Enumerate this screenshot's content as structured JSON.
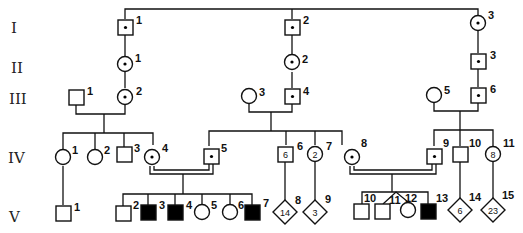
{
  "generations": [
    "I",
    "II",
    "III",
    "IV",
    "V"
  ],
  "colors": {
    "line": "#111111",
    "affected": "#000000",
    "unaffected": "#ffffff"
  },
  "legend_semantics": {
    "filled": "affected",
    "dot": "carrier",
    "double_line": "consanguineous mating",
    "diamond_number": "multiple individuals of unspecified sex"
  },
  "individuals": {
    "I-1": {
      "label": "1",
      "sex": "male",
      "status": "carrier"
    },
    "I-2": {
      "label": "2",
      "sex": "male",
      "status": "carrier"
    },
    "I-3": {
      "label": "3",
      "sex": "female",
      "status": "carrier"
    },
    "II-1": {
      "label": "1",
      "sex": "female",
      "status": "carrier"
    },
    "II-2": {
      "label": "2",
      "sex": "female",
      "status": "carrier"
    },
    "II-3": {
      "label": "3",
      "sex": "male",
      "status": "carrier"
    },
    "III-1": {
      "label": "1",
      "sex": "male",
      "status": "unaffected"
    },
    "III-2": {
      "label": "2",
      "sex": "female",
      "status": "carrier"
    },
    "III-3": {
      "label": "3",
      "sex": "female",
      "status": "unaffected"
    },
    "III-4": {
      "label": "4",
      "sex": "male",
      "status": "carrier"
    },
    "III-5": {
      "label": "5",
      "sex": "female",
      "status": "unaffected"
    },
    "III-6": {
      "label": "6",
      "sex": "male",
      "status": "carrier"
    },
    "IV-1": {
      "label": "1",
      "sex": "female",
      "status": "unaffected"
    },
    "IV-2": {
      "label": "2",
      "sex": "female",
      "status": "unaffected"
    },
    "IV-3": {
      "label": "3",
      "sex": "male",
      "status": "unaffected"
    },
    "IV-4": {
      "label": "4",
      "sex": "female",
      "status": "carrier"
    },
    "IV-5": {
      "label": "5",
      "sex": "male",
      "status": "carrier"
    },
    "IV-6": {
      "label": "6",
      "sex": "male",
      "status": "unaffected",
      "count": "6"
    },
    "IV-7": {
      "label": "7",
      "sex": "female",
      "status": "unaffected",
      "count": "2"
    },
    "IV-8": {
      "label": "8",
      "sex": "female",
      "status": "carrier"
    },
    "IV-9": {
      "label": "9",
      "sex": "male",
      "status": "carrier"
    },
    "IV-10": {
      "label": "10",
      "sex": "male",
      "status": "unaffected"
    },
    "IV-11": {
      "label": "11",
      "sex": "female",
      "status": "unaffected",
      "count": "8"
    },
    "V-1": {
      "label": "1",
      "sex": "male",
      "status": "unaffected"
    },
    "V-2": {
      "label": "2",
      "sex": "male",
      "status": "unaffected"
    },
    "V-3": {
      "label": "3",
      "sex": "male",
      "status": "affected"
    },
    "V-4": {
      "label": "4",
      "sex": "male",
      "status": "affected"
    },
    "V-5": {
      "label": "5",
      "sex": "female",
      "status": "unaffected"
    },
    "V-6": {
      "label": "6",
      "sex": "female",
      "status": "unaffected"
    },
    "V-7": {
      "label": "7",
      "sex": "male",
      "status": "affected"
    },
    "V-8": {
      "label": "8",
      "sex": "unknown",
      "status": "unaffected",
      "count": "14"
    },
    "V-9": {
      "label": "9",
      "sex": "unknown",
      "status": "unaffected",
      "count": "3"
    },
    "V-10": {
      "label": "10",
      "sex": "male",
      "status": "unaffected"
    },
    "V-11": {
      "label": "11",
      "sex": "male",
      "status": "unaffected",
      "twin_with": "V-12"
    },
    "V-12": {
      "label": "12",
      "sex": "female",
      "status": "unaffected",
      "twin_with": "V-11"
    },
    "V-13": {
      "label": "13",
      "sex": "male",
      "status": "affected"
    },
    "V-14": {
      "label": "14",
      "sex": "unknown",
      "status": "unaffected",
      "count": "6"
    },
    "V-15": {
      "label": "15",
      "sex": "unknown",
      "status": "unaffected",
      "count": "23"
    }
  }
}
